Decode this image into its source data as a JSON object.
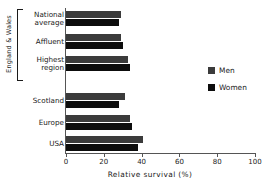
{
  "chart_data": {
    "type": "bar",
    "orientation": "horizontal",
    "title": "",
    "xlabel": "Relative  survival   (%)",
    "ylabel": "",
    "xlim": [
      0,
      100
    ],
    "xticks": [
      0,
      20,
      40,
      60,
      80,
      100
    ],
    "grid": false,
    "legend_position": "right",
    "categories": [
      "National\naverage",
      "Affluent",
      "Highest\nregion",
      "Scotland",
      "Europe",
      "USA"
    ],
    "category_lines": [
      [
        "National",
        "average"
      ],
      [
        "Affluent"
      ],
      [
        "Highest",
        "region"
      ],
      [
        "Scotland"
      ],
      [
        "Europe"
      ],
      [
        "USA"
      ]
    ],
    "series": [
      {
        "name": "Men",
        "color": "#3b3b3b",
        "values": [
          29,
          29,
          33,
          31,
          34,
          41
        ]
      },
      {
        "name": "Women",
        "color": "#0d0d0d",
        "values": [
          28,
          30,
          34,
          28,
          35,
          38
        ]
      }
    ],
    "group_bracket": {
      "label": "England & Wales",
      "categories": [
        "National average",
        "Affluent",
        "Highest region"
      ]
    }
  },
  "legend": {
    "items": [
      {
        "label": "Men",
        "color": "#3b3b3b"
      },
      {
        "label": "Women",
        "color": "#0d0d0d"
      }
    ]
  },
  "axis": {
    "x_title": "Relative  survival   (%)",
    "tick_labels": [
      "0",
      "20",
      "40",
      "60",
      "80",
      "100"
    ]
  }
}
